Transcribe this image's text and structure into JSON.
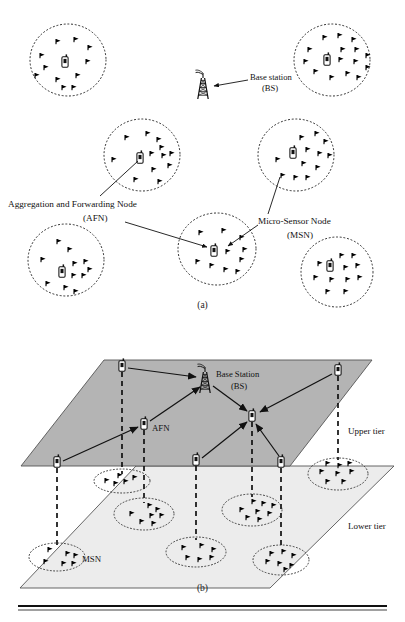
{
  "figure": {
    "panels": [
      {
        "id": "a",
        "caption": "(a)",
        "labels": {
          "base_station": "Base station",
          "base_station_abbr": "(BS)",
          "afn": "Aggregation and Forwarding Node",
          "afn_abbr": "(AFN)",
          "msn": "Micro-Sensor Node",
          "msn_abbr": "(MSN)"
        },
        "clusters": [
          {
            "name": "cluster-top-left",
            "cx": 68,
            "cy": 60,
            "rx": 38,
            "ry": 36,
            "sensor_count": 11
          },
          {
            "name": "cluster-top-right",
            "cx": 332,
            "cy": 60,
            "rx": 38,
            "ry": 36,
            "sensor_count": 15
          },
          {
            "name": "cluster-mid-left",
            "cx": 142,
            "cy": 155,
            "rx": 38,
            "ry": 36,
            "sensor_count": 12
          },
          {
            "name": "cluster-mid-right",
            "cx": 296,
            "cy": 155,
            "rx": 38,
            "ry": 36,
            "sensor_count": 12
          },
          {
            "name": "cluster-center-bottom",
            "cx": 217,
            "cy": 249,
            "rx": 39,
            "ry": 36,
            "sensor_count": 10
          },
          {
            "name": "cluster-bottom-left",
            "cx": 66,
            "cy": 260,
            "rx": 38,
            "ry": 36,
            "sensor_count": 11
          },
          {
            "name": "cluster-bottom-right",
            "cx": 337,
            "cy": 272,
            "rx": 36,
            "ry": 35,
            "sensor_count": 11
          }
        ],
        "base_station_position": {
          "x": 203,
          "y": 84
        }
      },
      {
        "id": "b",
        "caption": "(b)",
        "labels": {
          "base_station": "Base Station",
          "base_station_abbr": "(BS)",
          "afn": "AFN",
          "msn": "MSN",
          "upper_tier": "Upper tier",
          "lower_tier": "Lower tier"
        },
        "upper_tier_nodes": [
          {
            "name": "afn-upper-1",
            "x": 122,
            "y": 366
          },
          {
            "name": "afn-upper-2",
            "x": 144,
            "y": 424
          },
          {
            "name": "afn-upper-3",
            "x": 57,
            "y": 462
          },
          {
            "name": "afn-upper-4",
            "x": 196,
            "y": 460
          },
          {
            "name": "afn-upper-5",
            "x": 252,
            "y": 416
          },
          {
            "name": "afn-upper-6",
            "x": 281,
            "y": 462
          },
          {
            "name": "afn-upper-7",
            "x": 338,
            "y": 370
          }
        ],
        "lower_tier_clusters": [
          {
            "name": "msn-cluster-1",
            "cx": 122,
            "cy": 481,
            "rx": 28,
            "ry": 12
          },
          {
            "name": "msn-cluster-2",
            "cx": 144,
            "cy": 514,
            "rx": 30,
            "ry": 16
          },
          {
            "name": "msn-cluster-3",
            "cx": 57,
            "cy": 557,
            "rx": 28,
            "ry": 14
          },
          {
            "name": "msn-cluster-4",
            "cx": 196,
            "cy": 552,
            "rx": 30,
            "ry": 15
          },
          {
            "name": "msn-cluster-5",
            "cx": 252,
            "cy": 510,
            "rx": 30,
            "ry": 16
          },
          {
            "name": "msn-cluster-6",
            "cx": 281,
            "cy": 560,
            "rx": 28,
            "ry": 15
          },
          {
            "name": "msn-cluster-7",
            "cx": 338,
            "cy": 474,
            "rx": 30,
            "ry": 16
          }
        ],
        "base_station_position": {
          "x": 205,
          "y": 378
        }
      }
    ],
    "colors": {
      "upper_plane_fill": "#b4b4b4",
      "lower_plane_fill": "#ececec",
      "stroke": "#1a1a1a",
      "node_fill": "#ffffff",
      "sensor_fill": "#000000"
    }
  }
}
